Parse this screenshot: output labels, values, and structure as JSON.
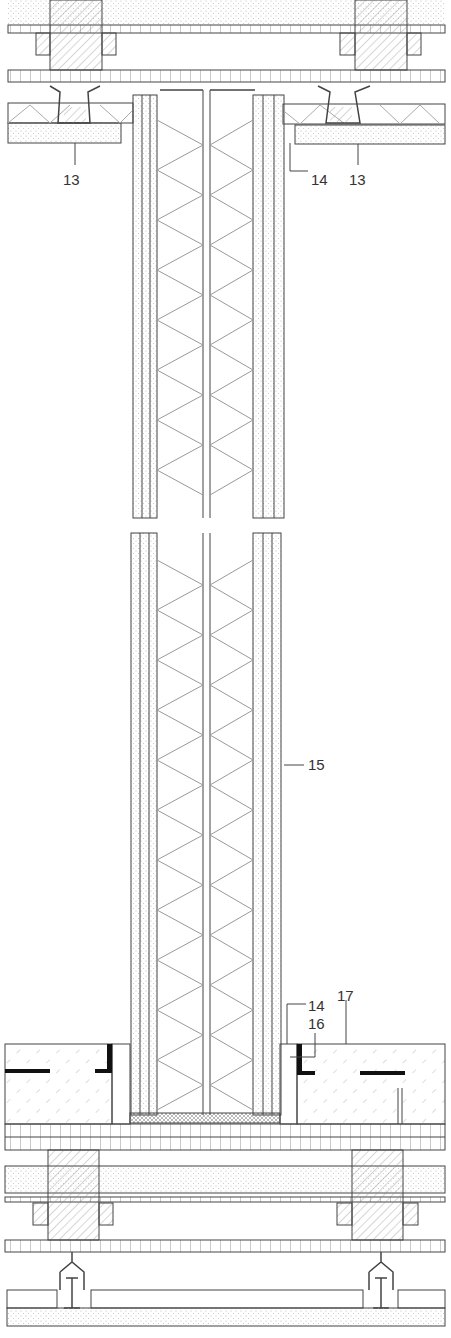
{
  "drawing": {
    "type": "architectural-wall-section",
    "line_color": "#444444",
    "fill_dots": "#bbbbbb",
    "callouts": [
      {
        "id": "c13a",
        "text": "13",
        "x": 63,
        "y": 172
      },
      {
        "id": "c14a",
        "text": "14",
        "x": 311,
        "y": 172
      },
      {
        "id": "c13b",
        "text": "13",
        "x": 349,
        "y": 172
      },
      {
        "id": "c15",
        "text": "15",
        "x": 308,
        "y": 757
      },
      {
        "id": "c17",
        "text": "17",
        "x": 337,
        "y": 988
      },
      {
        "id": "c14b",
        "text": "14",
        "x": 308,
        "y": 998
      },
      {
        "id": "c16",
        "text": "16",
        "x": 308,
        "y": 1016
      }
    ]
  }
}
